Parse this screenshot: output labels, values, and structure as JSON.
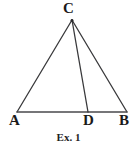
{
  "figure": {
    "caption": "Ex. 1",
    "background_color": "#ffffff",
    "stroke_color": "#39393b",
    "label_color": "#1a1a1a",
    "stroke_width": 1.3,
    "labels": {
      "apex": "C",
      "base_left": "A",
      "base_mid": "D",
      "base_right": "B"
    }
  },
  "chart_data": {
    "type": "diagram",
    "title": "Ex. 1",
    "subtitle": "",
    "xlabel": "",
    "ylabel": "",
    "grid": false,
    "legend": "none",
    "xlim": [
      0,
      137
    ],
    "ylim": [
      0,
      151
    ],
    "points": [
      {
        "name": "C",
        "x": 72,
        "y": 20,
        "label": "C",
        "label_x": 63,
        "label_y": 1
      },
      {
        "name": "A",
        "x": 17,
        "y": 112,
        "label": "A",
        "label_x": 9,
        "label_y": 113
      },
      {
        "name": "D",
        "x": 88,
        "y": 112,
        "label": "D",
        "label_x": 83,
        "label_y": 113
      },
      {
        "name": "B",
        "x": 127,
        "y": 112,
        "label": "B",
        "label_x": 119,
        "label_y": 113
      }
    ],
    "segments": [
      {
        "name": "side-AC",
        "from": "A",
        "to": "C",
        "x1": 17,
        "y1": 112,
        "x2": 72,
        "y2": 20
      },
      {
        "name": "side-CB",
        "from": "C",
        "to": "B",
        "x1": 72,
        "y1": 20,
        "x2": 127,
        "y2": 112
      },
      {
        "name": "base-AB",
        "from": "A",
        "to": "B",
        "x1": 17,
        "y1": 112,
        "x2": 127,
        "y2": 112
      },
      {
        "name": "cevian-CD",
        "from": "C",
        "to": "D",
        "x1": 72,
        "y1": 20,
        "x2": 88,
        "y2": 112
      }
    ],
    "annotations": [
      {
        "text": "Ex. 1",
        "x": 68,
        "y": 138,
        "role": "caption"
      }
    ]
  }
}
